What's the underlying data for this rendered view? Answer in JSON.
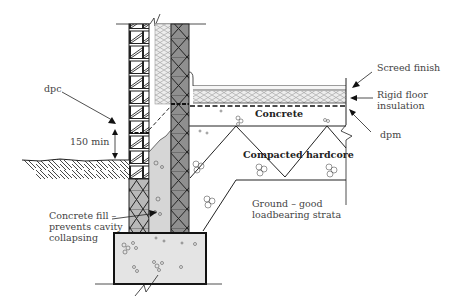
{
  "diagram": {
    "type": "construction-section",
    "labels": {
      "dpc": "dpc",
      "dimension": "150 min",
      "concrete_fill_1": "Concrete fill –",
      "concrete_fill_2": "prevents cavity",
      "concrete_fill_3": "collapsing",
      "screed": "Screed finish",
      "insulation_1": "Rigid floor",
      "insulation_2": "insulation",
      "dpm": "dpm",
      "concrete": "Concrete",
      "hardcore": "Compacted hardcore",
      "ground_1": "Ground – good",
      "ground_2": "loadbearing strata"
    },
    "colors": {
      "line": "#222222",
      "blockwork_fill": "#8a8a8a",
      "insulation_fill": "#e6e6e6",
      "concrete_fill": "#e3e3e3",
      "label_text": "#444444"
    }
  }
}
